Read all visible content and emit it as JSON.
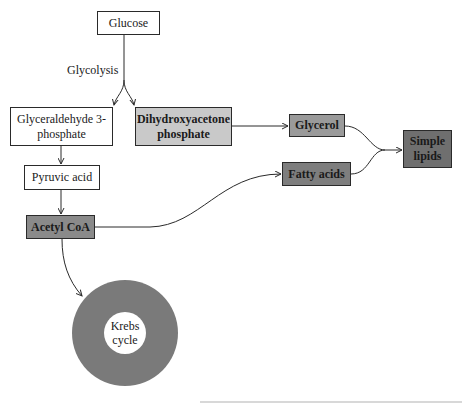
{
  "diagram": {
    "edge_label": "Glycolysis",
    "nodes": {
      "glucose": {
        "label": "Glucose",
        "fill": "#ffffff"
      },
      "g3p": {
        "label": "Glyceraldehyde 3-phosphate",
        "line1": "Glyceraldehyde 3-",
        "line2": "phosphate",
        "fill": "#ffffff"
      },
      "dhap": {
        "label": "Dihydroxyacetone phosphate",
        "line1": "Dihydroxyacetone",
        "line2": "phosphate",
        "fill": "#c9c9c9"
      },
      "pyruvic": {
        "label": "Pyruvic acid",
        "fill": "#ffffff"
      },
      "acetyl": {
        "label": "Acetyl CoA",
        "fill": "#8a8a8a"
      },
      "glycerol": {
        "label": "Glycerol",
        "fill": "#9a9a9a"
      },
      "fatty": {
        "label": "Fatty acids",
        "fill": "#7e7e7e"
      },
      "lipids": {
        "label": "Simple lipids",
        "line1": "Simple",
        "line2": "lipids",
        "fill": "#6f6f6f"
      },
      "krebs": {
        "label": "Krebs cycle",
        "line1": "Krebs",
        "line2": "cycle",
        "fill": "#7a7a7a"
      }
    },
    "edges": [
      {
        "from": "Glucose",
        "to": "Glyceraldehyde 3-phosphate",
        "label": "Glycolysis"
      },
      {
        "from": "Glucose",
        "to": "Dihydroxyacetone phosphate",
        "label": "Glycolysis"
      },
      {
        "from": "Glyceraldehyde 3-phosphate",
        "to": "Pyruvic acid"
      },
      {
        "from": "Pyruvic acid",
        "to": "Acetyl CoA"
      },
      {
        "from": "Acetyl CoA",
        "to": "Krebs cycle"
      },
      {
        "from": "Acetyl CoA",
        "to": "Fatty acids"
      },
      {
        "from": "Dihydroxyacetone phosphate",
        "to": "Glycerol"
      },
      {
        "from": "Glycerol",
        "to": "Simple lipids"
      },
      {
        "from": "Fatty acids",
        "to": "Simple lipids"
      }
    ],
    "colors": {
      "line": "#2a2a2a",
      "white": "#ffffff",
      "light_gray": "#c9c9c9",
      "medium_gray": "#9a9a9a",
      "dark_gray": "#7e7e7e",
      "darker_gray": "#6f6f6f",
      "ring": "#7a7a7a"
    }
  }
}
